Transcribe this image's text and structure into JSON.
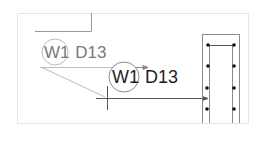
{
  "diagram": {
    "title": "",
    "labels": [
      {
        "id": "label-ghost",
        "wall": "W1",
        "bar": "D13",
        "state": "original-position"
      },
      {
        "id": "label-moved",
        "wall": "W1",
        "bar": "D13",
        "state": "moved-position"
      }
    ],
    "column": {
      "rebar_dots_per_side": 4,
      "rebar_columns": 2
    },
    "colors": {
      "frame": "#e6e6e6",
      "line": "#555555",
      "faded_line": "#b0b0b0",
      "text": "#1e1e1e",
      "faded_text": "#7a7a7a",
      "dot": "#111111"
    }
  }
}
